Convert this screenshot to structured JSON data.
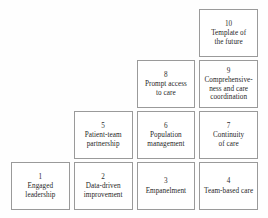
{
  "diagram": {
    "type": "staircase-building-blocks",
    "colors": {
      "border": "#9a9a9a",
      "text": "#1f1f1f",
      "background": "#fefefe"
    },
    "blocks": [
      {
        "number": "1",
        "label": "Engaged\nleadership",
        "row": 4,
        "col": 1
      },
      {
        "number": "2",
        "label": "Data-driven\nimprovement",
        "row": 4,
        "col": 2
      },
      {
        "number": "3",
        "label": "Empanelment",
        "row": 4,
        "col": 3
      },
      {
        "number": "4",
        "label": "Team-based care",
        "row": 4,
        "col": 4
      },
      {
        "number": "5",
        "label": "Patient-team\npartnership",
        "row": 3,
        "col": 2
      },
      {
        "number": "6",
        "label": "Population\nmanagement",
        "row": 3,
        "col": 3
      },
      {
        "number": "7",
        "label": "Continuity\nof care",
        "row": 3,
        "col": 4
      },
      {
        "number": "8",
        "label": "Prompt access\nto care",
        "row": 2,
        "col": 3
      },
      {
        "number": "9",
        "label": "Comprehensive-\nness and care\ncoordination",
        "row": 2,
        "col": 4
      },
      {
        "number": "10",
        "label": "Template of\nthe future",
        "row": 1,
        "col": 4
      }
    ]
  }
}
